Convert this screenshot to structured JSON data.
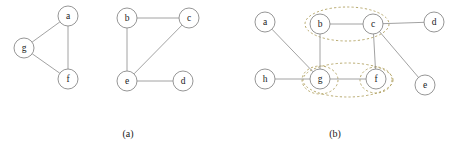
{
  "figure": {
    "title": "",
    "background_color": "#ffffff",
    "node_stroke_color": "#8a8a8a",
    "edge_color": "#8a8a8a",
    "group_stroke_color": "#b0a060",
    "label_color": "#1a1a1a",
    "node_radius": 10,
    "panels": [
      {
        "id": "panel-a",
        "caption": "(a)",
        "caption_x": 128,
        "caption_y": 136,
        "nodes": [
          {
            "id": "a",
            "label": "a",
            "x": 68,
            "y": 16
          },
          {
            "id": "g",
            "label": "g",
            "x": 24,
            "y": 48
          },
          {
            "id": "f",
            "label": "f",
            "x": 68,
            "y": 79
          },
          {
            "id": "b",
            "label": "b",
            "x": 127,
            "y": 18
          },
          {
            "id": "c",
            "label": "c",
            "x": 189,
            "y": 18
          },
          {
            "id": "e",
            "label": "e",
            "x": 127,
            "y": 81
          },
          {
            "id": "d",
            "label": "d",
            "x": 183,
            "y": 81
          }
        ],
        "edges": [
          {
            "from": "a",
            "to": "g"
          },
          {
            "from": "a",
            "to": "f"
          },
          {
            "from": "g",
            "to": "f"
          },
          {
            "from": "b",
            "to": "c"
          },
          {
            "from": "b",
            "to": "e"
          },
          {
            "from": "c",
            "to": "e"
          },
          {
            "from": "e",
            "to": "d"
          }
        ],
        "groups": []
      },
      {
        "id": "panel-b",
        "caption": "(b)",
        "caption_x": 335,
        "caption_y": 136,
        "nodes": [
          {
            "id": "a",
            "label": "a",
            "x": 265,
            "y": 22
          },
          {
            "id": "b",
            "label": "b",
            "x": 320,
            "y": 24
          },
          {
            "id": "c",
            "label": "c",
            "x": 373,
            "y": 24
          },
          {
            "id": "d",
            "label": "d",
            "x": 434,
            "y": 22
          },
          {
            "id": "h",
            "label": "h",
            "x": 265,
            "y": 79
          },
          {
            "id": "g",
            "label": "g",
            "x": 320,
            "y": 79
          },
          {
            "id": "f",
            "label": "f",
            "x": 376,
            "y": 79
          },
          {
            "id": "e",
            "label": "e",
            "x": 425,
            "y": 85
          }
        ],
        "edges": [
          {
            "from": "a",
            "to": "g"
          },
          {
            "from": "b",
            "to": "c"
          },
          {
            "from": "b",
            "to": "g"
          },
          {
            "from": "c",
            "to": "d"
          },
          {
            "from": "c",
            "to": "f"
          },
          {
            "from": "c",
            "to": "e"
          },
          {
            "from": "g",
            "to": "f"
          },
          {
            "from": "h",
            "to": "g"
          }
        ],
        "groups": [
          {
            "id": "group-bc",
            "members": [
              "b",
              "c"
            ],
            "cx": 347,
            "cy": 24,
            "rx": 42,
            "ry": 17
          },
          {
            "id": "group-gf",
            "members": [
              "g",
              "f"
            ],
            "cx": 348,
            "cy": 80,
            "rx": 45,
            "ry": 17
          },
          {
            "id": "group-g",
            "members": [
              "g"
            ],
            "cx": 320,
            "cy": 80,
            "rx": 18,
            "ry": 14
          },
          {
            "id": "group-f",
            "members": [
              "f"
            ],
            "cx": 376,
            "cy": 80,
            "rx": 16,
            "ry": 13
          }
        ]
      }
    ]
  }
}
